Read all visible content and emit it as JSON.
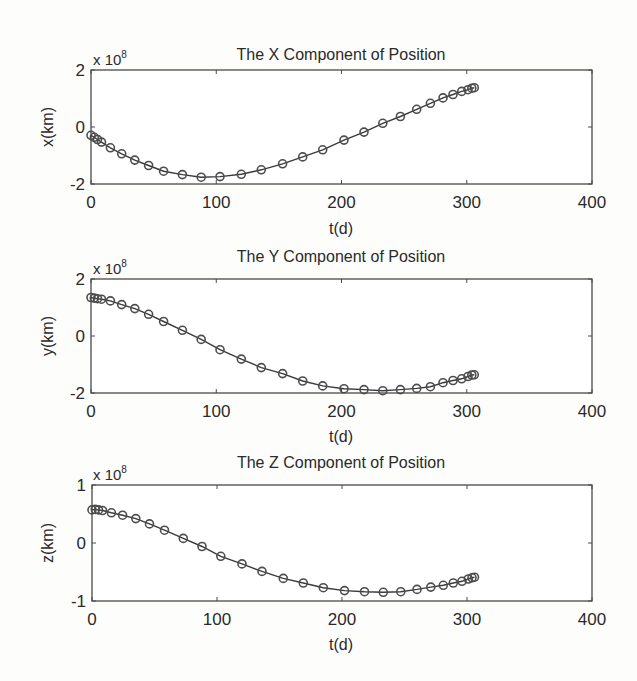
{
  "chart_data": [
    {
      "type": "line",
      "title": "The X Component of Position",
      "xlabel": "t(d)",
      "ylabel": "x(km)",
      "y_multiplier_label": "x 10",
      "y_multiplier_exponent": "8",
      "xlim": [
        0,
        400
      ],
      "ylim": [
        -2,
        2
      ],
      "xticks": [
        0,
        100,
        200,
        300,
        400
      ],
      "xtick_labels": [
        "0",
        "100",
        "200",
        "300",
        "400"
      ],
      "yticks": [
        -2,
        0,
        2
      ],
      "ytick_labels": [
        "-2",
        "0",
        "2"
      ],
      "grid": false,
      "marker": "circle",
      "series": [
        {
          "name": "x",
          "x": [
            0,
            2.6,
            5.2,
            8.4,
            15.5,
            24.5,
            35,
            46,
            58,
            73,
            88,
            103,
            120,
            136,
            153,
            169,
            185,
            202,
            218,
            233,
            247,
            260,
            271,
            281,
            289,
            296,
            301,
            304,
            306
          ],
          "y": [
            -0.29,
            -0.36,
            -0.44,
            -0.53,
            -0.73,
            -0.94,
            -1.16,
            -1.35,
            -1.55,
            -1.67,
            -1.76,
            -1.74,
            -1.66,
            -1.5,
            -1.29,
            -1.05,
            -0.8,
            -0.46,
            -0.18,
            0.13,
            0.37,
            0.62,
            0.83,
            1.02,
            1.14,
            1.25,
            1.31,
            1.36,
            1.38
          ]
        }
      ]
    },
    {
      "type": "line",
      "title": "The Y Component of Position",
      "xlabel": "t(d)",
      "ylabel": "y(km)",
      "y_multiplier_label": "x 10",
      "y_multiplier_exponent": "8",
      "xlim": [
        0,
        400
      ],
      "ylim": [
        -2,
        2
      ],
      "xticks": [
        0,
        100,
        200,
        300,
        400
      ],
      "xtick_labels": [
        "0",
        "100",
        "200",
        "300",
        "400"
      ],
      "yticks": [
        -2,
        0,
        2
      ],
      "ytick_labels": [
        "-2",
        "0",
        "2"
      ],
      "grid": false,
      "marker": "circle",
      "series": [
        {
          "name": "y",
          "x": [
            0,
            2.6,
            5.2,
            8.4,
            15.5,
            24.5,
            35,
            46,
            58,
            73,
            88,
            103,
            120,
            136,
            153,
            169,
            185,
            202,
            218,
            233,
            247,
            260,
            271,
            281,
            289,
            296,
            301,
            304,
            306
          ],
          "y": [
            1.35,
            1.33,
            1.31,
            1.29,
            1.23,
            1.1,
            0.96,
            0.76,
            0.51,
            0.2,
            -0.12,
            -0.48,
            -0.81,
            -1.11,
            -1.32,
            -1.58,
            -1.75,
            -1.85,
            -1.88,
            -1.92,
            -1.88,
            -1.84,
            -1.78,
            -1.64,
            -1.56,
            -1.5,
            -1.42,
            -1.37,
            -1.36
          ]
        }
      ]
    },
    {
      "type": "line",
      "title": "The Z Component of Position",
      "xlabel": "t(d)",
      "ylabel": "z(km)",
      "y_multiplier_label": "x 10",
      "y_multiplier_exponent": "8",
      "xlim": [
        0,
        400
      ],
      "ylim": [
        -1,
        1
      ],
      "xticks": [
        0,
        100,
        200,
        300,
        400
      ],
      "xtick_labels": [
        "0",
        "100",
        "200",
        "300",
        "400"
      ],
      "yticks": [
        -1,
        0,
        1
      ],
      "ytick_labels": [
        "-1",
        "0",
        "1"
      ],
      "grid": false,
      "marker": "circle",
      "series": [
        {
          "name": "z",
          "x": [
            0,
            2.6,
            5.2,
            8.4,
            15.5,
            24.5,
            35,
            46,
            58,
            73,
            88,
            103,
            120,
            136,
            153,
            169,
            185,
            202,
            218,
            233,
            247,
            260,
            271,
            281,
            289,
            296,
            301,
            304,
            306
          ],
          "y": [
            0.57,
            0.58,
            0.57,
            0.56,
            0.52,
            0.48,
            0.42,
            0.33,
            0.22,
            0.08,
            -0.06,
            -0.23,
            -0.36,
            -0.49,
            -0.61,
            -0.69,
            -0.77,
            -0.82,
            -0.84,
            -0.85,
            -0.84,
            -0.8,
            -0.76,
            -0.73,
            -0.69,
            -0.66,
            -0.62,
            -0.6,
            -0.59
          ]
        }
      ]
    }
  ],
  "colors": {
    "background": "#fdfdfb",
    "axes_face": "#ffffff",
    "line": "#3a3a3a",
    "marker": "#4d4d4d",
    "text": "#2a2a2a"
  }
}
